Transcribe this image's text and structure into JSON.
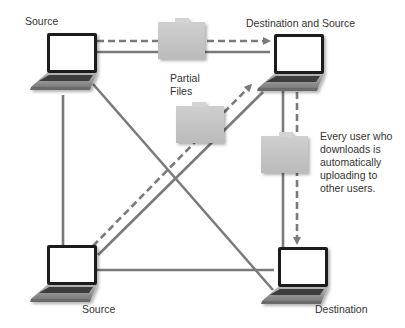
{
  "nodes": {
    "top_left": {
      "label": "Source"
    },
    "top_right": {
      "label": "Destination and Source"
    },
    "bottom_left": {
      "label": "Source"
    },
    "bottom_right": {
      "label": "Destination"
    }
  },
  "folders_label": {
    "line1": "Partial",
    "line2": "Files"
  },
  "note": {
    "line1": "Every user who",
    "line2": "downloads is",
    "line3": "automatically",
    "line4": "uploading to",
    "line5": "other users."
  },
  "colors": {
    "line": "#7a7a7a",
    "folder": "#c4c4c4",
    "folder_tab": "#d2d2d2",
    "screen": "#ffffff",
    "bezel": "#1e1e1e",
    "laptop_base": "#9a9a9a",
    "text": "#333333"
  }
}
